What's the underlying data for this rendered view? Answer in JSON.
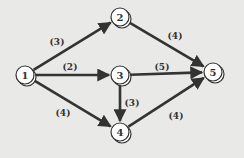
{
  "diagram": {
    "type": "directed-network",
    "colors": {
      "background": "#e9e9e7",
      "edge": "#333333",
      "node_fill": "#ffffff",
      "node_stroke": "#333333",
      "label": "#333333"
    },
    "nodes": [
      {
        "id": "1",
        "label": "1",
        "x": 25,
        "y": 75
      },
      {
        "id": "2",
        "label": "2",
        "x": 120,
        "y": 17
      },
      {
        "id": "3",
        "label": "3",
        "x": 120,
        "y": 75
      },
      {
        "id": "4",
        "label": "4",
        "x": 120,
        "y": 132
      },
      {
        "id": "5",
        "label": "5",
        "x": 213,
        "y": 72
      }
    ],
    "edges": [
      {
        "from": "1",
        "to": "2",
        "weight": "(3)",
        "lx": 57,
        "ly": 45
      },
      {
        "from": "1",
        "to": "3",
        "weight": "(2)",
        "lx": 70,
        "ly": 70
      },
      {
        "from": "1",
        "to": "4",
        "weight": "(4)",
        "lx": 63,
        "ly": 116
      },
      {
        "from": "2",
        "to": "5",
        "weight": "(4)",
        "lx": 175,
        "ly": 39
      },
      {
        "from": "3",
        "to": "5",
        "weight": "(5)",
        "lx": 162,
        "ly": 70
      },
      {
        "from": "3",
        "to": "4",
        "weight": "(3)",
        "lx": 132,
        "ly": 106
      },
      {
        "from": "4",
        "to": "5",
        "weight": "(4)",
        "lx": 176,
        "ly": 119
      }
    ]
  }
}
